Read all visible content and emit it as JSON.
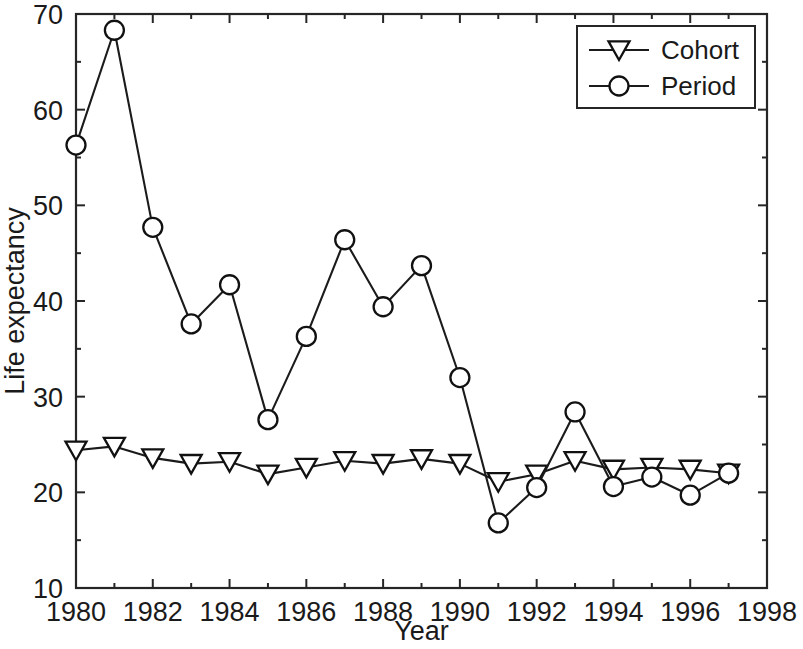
{
  "chart_data": {
    "type": "line",
    "title": "",
    "xlabel": "Year",
    "ylabel": "Life expectancy",
    "x": [
      1980,
      1981,
      1982,
      1983,
      1984,
      1985,
      1986,
      1987,
      1988,
      1989,
      1990,
      1991,
      1992,
      1993,
      1994,
      1995,
      1996,
      1997
    ],
    "series": [
      {
        "name": "Cohort",
        "marker": "triangle-down",
        "values": [
          24.4,
          24.8,
          23.6,
          23.0,
          23.2,
          21.9,
          22.6,
          23.3,
          23.0,
          23.5,
          23.0,
          21.1,
          21.9,
          23.3,
          22.4,
          22.6,
          22.4,
          22.0
        ]
      },
      {
        "name": "Period",
        "marker": "circle",
        "values": [
          56.3,
          68.3,
          47.7,
          37.6,
          41.7,
          27.6,
          36.3,
          46.4,
          39.4,
          43.7,
          32.0,
          16.8,
          20.5,
          28.4,
          20.6,
          21.6,
          19.7,
          22.0
        ]
      }
    ],
    "xlim": [
      1980,
      1998
    ],
    "ylim": [
      10,
      70
    ],
    "xticks": [
      1980,
      1982,
      1984,
      1986,
      1988,
      1990,
      1992,
      1994,
      1996,
      1998
    ],
    "xtick_labels": [
      "1980",
      "1982",
      "1984",
      "1986",
      "1988",
      "1990",
      "1992",
      "1994",
      "1996",
      "1998"
    ],
    "yticks": [
      10,
      20,
      30,
      40,
      50,
      60,
      70
    ],
    "ytick_labels": [
      "10",
      "20",
      "30",
      "40",
      "50",
      "60",
      "70"
    ],
    "grid": false,
    "legend_position": "top-right",
    "legend_entries": [
      "Cohort",
      "Period"
    ],
    "colors": {
      "line": "#1b1b1b",
      "marker_fill": "#ffffff",
      "axis": "#262626",
      "background": "#ffffff"
    }
  }
}
